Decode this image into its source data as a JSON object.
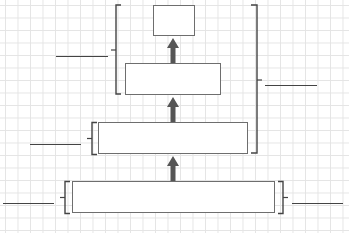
{
  "diagram": {
    "type": "pyramid-hierarchy",
    "levels": [
      {
        "id": "level-4",
        "label": "",
        "annotation": ""
      },
      {
        "id": "level-3",
        "label": "",
        "annotation": ""
      },
      {
        "id": "level-2",
        "label": "",
        "annotation": ""
      },
      {
        "id": "level-1",
        "label": "",
        "annotation": ""
      }
    ],
    "group_annotations": [
      {
        "id": "left-group-top",
        "label": ""
      },
      {
        "id": "right-group-top",
        "label": ""
      }
    ],
    "colors": {
      "box_border": "#6e6e6e",
      "arrow": "#555555",
      "bracket": "#444444",
      "grid": "#e4e4e4"
    }
  }
}
